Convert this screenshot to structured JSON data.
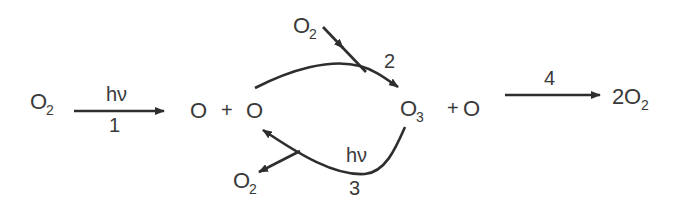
{
  "diagram": {
    "species": {
      "o2_reactant": {
        "base": "O",
        "sub": "2"
      },
      "o_atom_1": "O",
      "plus_1": "+",
      "o_atom_2": "O",
      "o2_top": {
        "base": "O",
        "sub": "2"
      },
      "o3": {
        "base": "O",
        "sub": "3"
      },
      "plus_2": "+",
      "o_atom_3": "O",
      "o2_bottom": {
        "base": "O",
        "sub": "2"
      },
      "product": {
        "coef": "2",
        "base": "O",
        "sub": "2"
      }
    },
    "reactions": [
      {
        "id": "1",
        "number_label": "1",
        "condition": "hν",
        "from": "O2",
        "to": "O + O"
      },
      {
        "id": "2",
        "number_label": "2",
        "condition": "",
        "from": "O + O2",
        "to": "O3"
      },
      {
        "id": "3",
        "number_label": "3",
        "condition": "hν",
        "from": "O3",
        "to": "O + O2"
      },
      {
        "id": "4",
        "number_label": "4",
        "condition": "",
        "from": "O3 + O",
        "to": "2O2"
      }
    ],
    "colors": {
      "ink": "#2e2e2e",
      "text": "#3a3a3a",
      "background": "#ffffff"
    }
  }
}
